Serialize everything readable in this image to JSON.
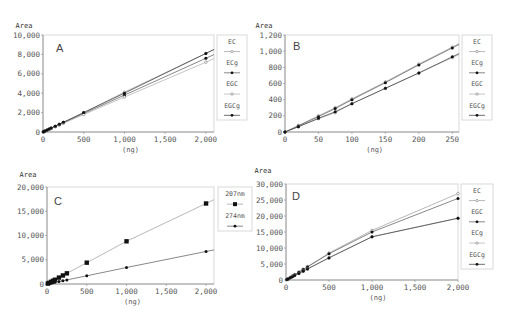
{
  "chart_data": [
    {
      "type": "line",
      "panel": "A",
      "ylabel": "Area",
      "xlabel": "(ng)",
      "xlim": [
        0,
        2100
      ],
      "ylim": [
        0,
        10000
      ],
      "xticks": [
        0,
        500,
        1000,
        1500,
        2000
      ],
      "xtick_labels": [
        "0",
        "500",
        "1,000",
        "1,500",
        "2,000"
      ],
      "yticks": [
        0,
        2000,
        4000,
        6000,
        8000,
        10000
      ],
      "ytick_labels": [
        "0",
        "2,000",
        "4,000",
        "6,000",
        "8,000",
        "10,000"
      ],
      "legend_position": "right",
      "x": [
        5,
        10,
        25,
        50,
        75,
        100,
        150,
        200,
        250,
        500,
        1000,
        2000
      ],
      "series": [
        {
          "name": "EC",
          "marker": "open",
          "values": [
            20,
            40,
            100,
            200,
            300,
            400,
            600,
            800,
            1000,
            2000,
            4100,
            8100
          ]
        },
        {
          "name": "ECg",
          "marker": "filled",
          "values": [
            19,
            38,
            95,
            190,
            285,
            380,
            570,
            760,
            950,
            1900,
            3800,
            7600
          ]
        },
        {
          "name": "EGC",
          "marker": "open",
          "values": [
            18,
            36,
            90,
            180,
            270,
            360,
            540,
            720,
            900,
            1800,
            3600,
            7200
          ]
        },
        {
          "name": "EGCg",
          "marker": "filled",
          "values": [
            20,
            40,
            100,
            200,
            300,
            400,
            600,
            800,
            1000,
            2000,
            4000,
            8100
          ]
        }
      ]
    },
    {
      "type": "line",
      "panel": "B",
      "ylabel": "Area",
      "xlabel": "(ng)",
      "xlim": [
        0,
        260
      ],
      "ylim": [
        0,
        1200
      ],
      "xticks": [
        0,
        50,
        100,
        150,
        200,
        250
      ],
      "xtick_labels": [
        "0",
        "50",
        "100",
        "150",
        "200",
        "250"
      ],
      "yticks": [
        0,
        200,
        400,
        600,
        800,
        1000,
        1200
      ],
      "ytick_labels": [
        "0",
        "200",
        "400",
        "600",
        "800",
        "1,000",
        "1,200"
      ],
      "legend_position": "right",
      "x": [
        0,
        20,
        50,
        75,
        100,
        150,
        200,
        250
      ],
      "series": [
        {
          "name": "EC",
          "marker": "open",
          "values": [
            0,
            80,
            200,
            300,
            410,
            620,
            840,
            1050
          ]
        },
        {
          "name": "ECg",
          "marker": "filled",
          "values": [
            0,
            75,
            190,
            290,
            400,
            610,
            830,
            1040
          ]
        },
        {
          "name": "EGC",
          "marker": "open",
          "values": [
            0,
            65,
            165,
            240,
            350,
            540,
            730,
            920
          ]
        },
        {
          "name": "EGCg",
          "marker": "filled",
          "values": [
            0,
            65,
            170,
            250,
            350,
            540,
            730,
            930
          ]
        }
      ]
    },
    {
      "type": "line",
      "panel": "C",
      "ylabel": "Area",
      "xlabel": "(ng)",
      "xlim": [
        0,
        2100
      ],
      "ylim": [
        0,
        20000
      ],
      "xticks": [
        0,
        500,
        1000,
        1500,
        2000
      ],
      "xtick_labels": [
        "0",
        "500",
        "1,000",
        "1,500",
        "2,000"
      ],
      "yticks": [
        0,
        5000,
        10000,
        15000,
        20000
      ],
      "ytick_labels": [
        "0",
        "5,000",
        "10,000",
        "15,000",
        "20,000"
      ],
      "legend_position": "right",
      "x": [
        10,
        25,
        50,
        75,
        100,
        150,
        200,
        250,
        500,
        1000,
        2000
      ],
      "series": [
        {
          "name": "207nm",
          "marker": "square",
          "values": [
            90,
            220,
            440,
            660,
            880,
            1320,
            1760,
            2200,
            4400,
            8800,
            16600
          ]
        },
        {
          "name": "274nm",
          "marker": "filled",
          "values": [
            35,
            85,
            170,
            250,
            340,
            510,
            680,
            850,
            1700,
            3400,
            6700
          ]
        }
      ]
    },
    {
      "type": "line",
      "panel": "D",
      "ylabel": "Area",
      "xlabel": "(ng)",
      "xlim": [
        0,
        2000
      ],
      "ylim": [
        0,
        30000
      ],
      "xticks": [
        0,
        500,
        1000,
        1500,
        2000
      ],
      "xtick_labels": [
        "0",
        "500",
        "1,000",
        "1,500",
        "2,000"
      ],
      "yticks": [
        0,
        5000,
        10000,
        15000,
        20000,
        25000,
        30000
      ],
      "ytick_labels": [
        "0",
        "5,000",
        "10,000",
        "15,000",
        "20,000",
        "25,000",
        "30,000"
      ],
      "legend_position": "right",
      "x": [
        10,
        25,
        50,
        75,
        100,
        150,
        200,
        250,
        500,
        1000,
        2000
      ],
      "series": [
        {
          "name": "EC",
          "marker": "open",
          "values": [
            170,
            420,
            840,
            1260,
            1680,
            2520,
            3360,
            4200,
            8400,
            15500,
            27000
          ]
        },
        {
          "name": "EGC",
          "marker": "filled",
          "values": [
            165,
            410,
            820,
            1230,
            1640,
            2460,
            3280,
            4100,
            8200,
            15000,
            25500
          ]
        },
        {
          "name": "ECg",
          "marker": "open",
          "values": [
            140,
            350,
            700,
            1050,
            1400,
            2100,
            2800,
            3500,
            7000,
            13500,
            19300
          ]
        },
        {
          "name": "EGCg",
          "marker": "filled",
          "values": [
            140,
            345,
            690,
            1030,
            1380,
            2070,
            2760,
            3450,
            6900,
            13500,
            19300
          ]
        }
      ]
    }
  ]
}
